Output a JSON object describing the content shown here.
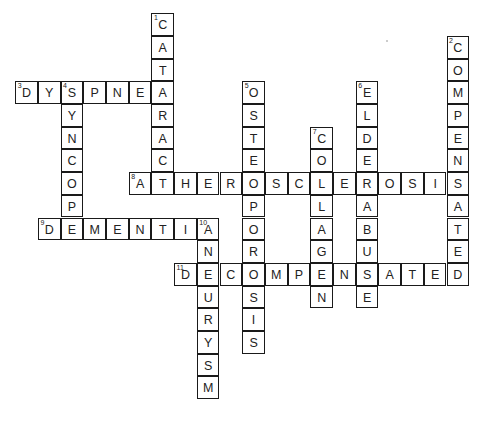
{
  "puzzle": {
    "type": "crossword",
    "cell_size_px": 22.7,
    "grid_origin": {
      "x": 16,
      "y": 14
    },
    "colors": {
      "border": "#1a1a1a",
      "text": "#222222",
      "background": "#ffffff"
    },
    "entries": [
      {
        "number": 1,
        "direction": "down",
        "col": 6,
        "row": 0,
        "answer": "CATARACT"
      },
      {
        "number": 2,
        "direction": "down",
        "col": 19,
        "row": 1,
        "answer": "COMPENSATED"
      },
      {
        "number": 3,
        "direction": "across",
        "col": 0,
        "row": 3,
        "answer": "DYSPNEA"
      },
      {
        "number": 4,
        "direction": "down",
        "col": 2,
        "row": 3,
        "answer": "SYNCOPE"
      },
      {
        "number": 5,
        "direction": "down",
        "col": 10,
        "row": 3,
        "answer": "OSTEOPOROSIS"
      },
      {
        "number": 6,
        "direction": "down",
        "col": 15,
        "row": 3,
        "answer": "ELDERABUSE"
      },
      {
        "number": 7,
        "direction": "down",
        "col": 13,
        "row": 5,
        "answer": "COLLAGEN"
      },
      {
        "number": 8,
        "direction": "across",
        "col": 5,
        "row": 7,
        "answer": "ATHEROSCLEROSIS"
      },
      {
        "number": 9,
        "direction": "across",
        "col": 1,
        "row": 9,
        "answer": "DEMENTIA"
      },
      {
        "number": 10,
        "direction": "down",
        "col": 8,
        "row": 9,
        "answer": "ANEURYSM"
      },
      {
        "number": 11,
        "direction": "across",
        "col": 7,
        "row": 11,
        "answer": "DECOMPENSATED"
      }
    ]
  }
}
